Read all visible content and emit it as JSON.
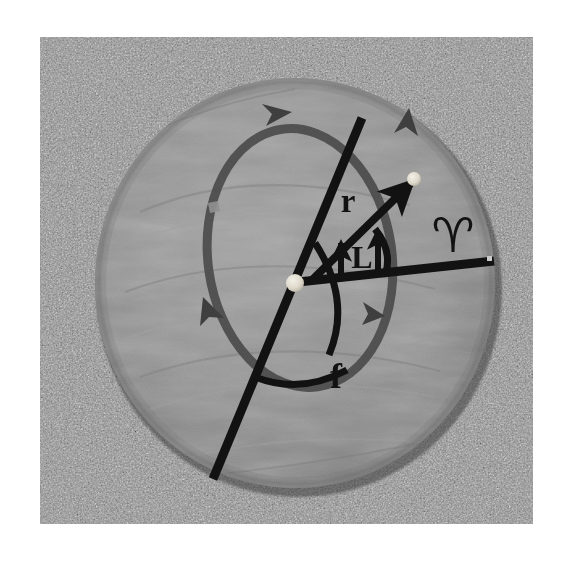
{
  "image": {
    "kind": "photograph",
    "description": "Black and white photograph of a round gray slate disc lying on gravel, with a taped orbital-mechanics diagram on its surface",
    "background_color": "#ffffff",
    "photo": {
      "x": 40,
      "y": 37,
      "width": 493,
      "height": 487,
      "gravel_base_color": "#8d8d8d",
      "gravel_light": "#d6d6d6",
      "gravel_dark": "#2e2e2e"
    }
  },
  "disc": {
    "name": "slate-disc",
    "center_x": 295,
    "center_y": 283,
    "radius_x": 200,
    "radius_y": 205,
    "fill_color": "#8e8e8e",
    "edge_shadow_color": "#6b6b6b"
  },
  "diagram": {
    "tape_dark_color": "#111111",
    "tape_gray_color": "#4a4a4a",
    "marker_dot_color": "#e8e4d8",
    "orbit_ellipse": {
      "name": "orbit-ellipse",
      "center_x": 300,
      "center_y": 258,
      "radius_x": 92,
      "radius_y": 130,
      "rotation_deg": -8,
      "stroke_color": "#4a4a4a",
      "stroke_width": 9,
      "direction": "counterclockwise-as-drawn",
      "arrowhead_count": 4
    },
    "apsides_line": {
      "name": "line-of-apsides",
      "x1": 362,
      "y1": 118,
      "x2": 213,
      "y2": 479,
      "stroke_color": "#111111",
      "stroke_width": 9
    },
    "vernal_line": {
      "name": "vernal-equinox-reference-line",
      "x1": 295,
      "y1": 283,
      "x2": 494,
      "y2": 262,
      "stroke_color": "#111111",
      "stroke_width": 9
    },
    "radius_vector": {
      "name": "radius-vector-r",
      "x1": 309,
      "y1": 282,
      "x2": 414,
      "y2": 180,
      "stroke_color": "#111111",
      "stroke_width": 8,
      "has_arrowhead": true
    },
    "focus_dot": {
      "name": "focus-star-dot",
      "cx": 295,
      "cy": 283,
      "r": 9
    },
    "planet_dot": {
      "name": "planet-dot",
      "cx": 414,
      "cy": 179,
      "r": 7
    },
    "true_anomaly_arc": {
      "name": "true-anomaly-arc-f",
      "stroke_color": "#111111",
      "stroke_width": 7
    },
    "longitude_arc": {
      "name": "longitude-arc-L",
      "stroke_color": "#111111",
      "stroke_width": 7
    }
  },
  "labels": [
    {
      "id": "label-r",
      "text": "r",
      "meaning": "radius vector / orbital radius",
      "x": 348,
      "y": 212,
      "font_size": 33,
      "font_style": "normal",
      "color": "#111111"
    },
    {
      "id": "label-L",
      "text": "L",
      "meaning": "true longitude",
      "x": 363,
      "y": 264,
      "font_size": 31,
      "font_style": "normal",
      "color": "#111111"
    },
    {
      "id": "label-f",
      "text": "f",
      "meaning": "true anomaly",
      "x": 333,
      "y": 385,
      "font_size": 34,
      "font_style": "normal",
      "color": "#111111"
    },
    {
      "id": "label-aries",
      "text": "♈",
      "meaning": "Aries / vernal equinox direction",
      "x": 452,
      "y": 248,
      "font_size": 46,
      "font_style": "normal",
      "color": "#111111"
    }
  ],
  "measurement_arrows": [
    {
      "id": "L-bracket-arrow-left",
      "x": 341,
      "y_top": 243,
      "y_bottom": 278
    },
    {
      "id": "L-bracket-arrow-right",
      "x": 385,
      "y_top": 232,
      "y_bottom": 270
    }
  ]
}
